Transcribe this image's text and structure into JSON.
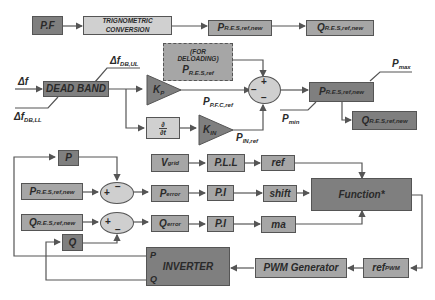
{
  "diagram": {
    "top_row": {
      "pf": {
        "main": "P.F",
        "sub": ""
      },
      "trig": {
        "line1": "TRIGNOMETRIC",
        "line2": "CONVERSION"
      },
      "p_res_new": {
        "main": "P",
        "sub": "R.E.S,ref,new"
      },
      "q_res_new": {
        "main": "Q",
        "sub": "R.E.S,ref,new"
      }
    },
    "deloading": {
      "line1": "(FOR",
      "line2": "DELOADING)",
      "main": "P",
      "sub": "R.E.S,ref"
    },
    "inputs": {
      "delta_f": {
        "main": "Δf",
        "sub": ""
      },
      "delta_f_ul": {
        "main": "Δf",
        "sub": "DB,UL"
      },
      "delta_f_ll": {
        "main": "Δf",
        "sub": "DB,LL"
      }
    },
    "dead_band": "DEAD BAND",
    "kp": {
      "main": "K",
      "sub": "P"
    },
    "kin": {
      "main": "K",
      "sub": "IN"
    },
    "derivative": {
      "num": "∂",
      "den": "∂t"
    },
    "signals": {
      "p_pfc": {
        "main": "P",
        "sub": "P.F.C,ref"
      },
      "p_in": {
        "main": "P",
        "sub": "IN,ref"
      },
      "p_max": {
        "main": "P",
        "sub": "max"
      },
      "p_min": {
        "main": "P",
        "sub": "min"
      }
    },
    "summer_top": {
      "plus": "+",
      "minus_left": "−",
      "minus_bottom": "−"
    },
    "limiter": {
      "main": "P",
      "sub": "R.E.S,ref,new"
    },
    "q_out": {
      "main": "Q",
      "sub": "R.E.S,ref,new"
    },
    "bottom": {
      "p_fb": "P",
      "q_fb": "Q",
      "p_ref_in": {
        "main": "P",
        "sub": "R.E.S,ref,new"
      },
      "q_ref_in": {
        "main": "Q",
        "sub": "R.E.S,ref,new"
      },
      "sum_p": {
        "plus": "+",
        "minus": "−"
      },
      "sum_q": {
        "plus": "+",
        "minus": "−"
      },
      "vgrid": {
        "main": "V",
        "sub": "grid"
      },
      "pll": "P.L.L",
      "ref": "ref",
      "perror": {
        "main": "P",
        "sub": "error"
      },
      "qerror": {
        "main": "Q",
        "sub": "error"
      },
      "pi1": "P.I",
      "pi2": "P.I",
      "shift": "shift",
      "ma": "ma",
      "function": "Function*",
      "inverter": "INVERTER",
      "inv_p": "P",
      "inv_q": "Q",
      "pwm": "PWM Generator",
      "ref_pwm": {
        "main": "ref",
        "sub": "PWM"
      }
    },
    "colors": {
      "dark": "#7f7f7f",
      "mid": "#a6a6a6",
      "light": "#d0d0d0",
      "line": "#555555"
    }
  }
}
